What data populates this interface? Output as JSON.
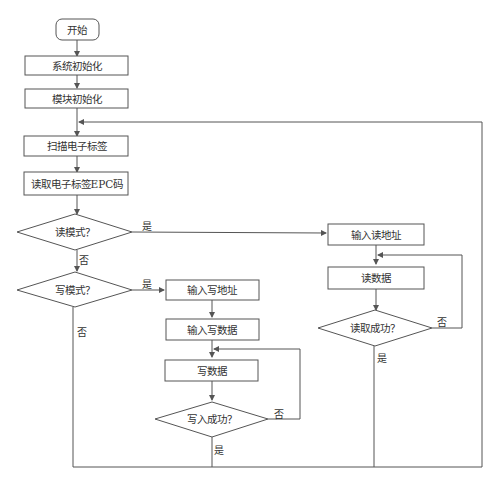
{
  "diagram": {
    "type": "flowchart",
    "nodes": {
      "start": "开始",
      "sys_init": "系统初始化",
      "mod_init": "模块初始化",
      "scan_tag": "扫描电子标签",
      "read_epc": "读取电子标签EPC码",
      "read_mode": "读模式？",
      "write_mode": "写模式？",
      "input_read_addr": "输入读地址",
      "read_data": "读数据",
      "read_success": "读取成功？",
      "input_write_addr": "输入写地址",
      "input_write_data": "输入写数据",
      "write_data": "写数据",
      "write_success": "写入成功？"
    },
    "labels": {
      "yes": "是",
      "no": "否"
    },
    "edges": [
      {
        "from": "start",
        "to": "sys_init"
      },
      {
        "from": "sys_init",
        "to": "mod_init"
      },
      {
        "from": "mod_init",
        "to": "scan_tag"
      },
      {
        "from": "scan_tag",
        "to": "read_epc"
      },
      {
        "from": "read_epc",
        "to": "read_mode"
      },
      {
        "from": "read_mode",
        "to": "input_read_addr",
        "label": "是"
      },
      {
        "from": "read_mode",
        "to": "write_mode",
        "label": "否"
      },
      {
        "from": "write_mode",
        "to": "input_write_addr",
        "label": "是"
      },
      {
        "from": "write_mode",
        "to": "scan_tag",
        "label": "否"
      },
      {
        "from": "input_write_addr",
        "to": "input_write_data"
      },
      {
        "from": "input_write_data",
        "to": "write_data"
      },
      {
        "from": "write_data",
        "to": "write_success"
      },
      {
        "from": "write_success",
        "to": "write_data",
        "label": "否"
      },
      {
        "from": "write_success",
        "to": "scan_tag",
        "label": "是"
      },
      {
        "from": "input_read_addr",
        "to": "read_data"
      },
      {
        "from": "read_data",
        "to": "read_success"
      },
      {
        "from": "read_success",
        "to": "read_data",
        "label": "否"
      },
      {
        "from": "read_success",
        "to": "scan_tag",
        "label": "是"
      }
    ]
  }
}
